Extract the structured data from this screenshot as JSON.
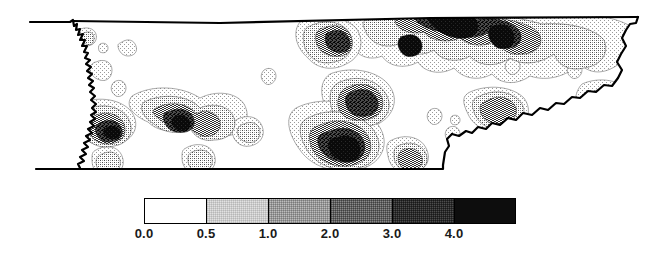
{
  "figure": {
    "type": "contour-map",
    "region": "Tennessee",
    "background_color": "#ffffff",
    "outline_color": "#000000"
  },
  "chart_data": {
    "type": "heatmap",
    "title": "",
    "subtitle": "",
    "xlabel": "",
    "ylabel": "",
    "projection": "state-outline",
    "region": "Tennessee",
    "grid": false,
    "legend_position": "bottom-center",
    "contour_levels": [
      0.0,
      0.5,
      1.0,
      2.0,
      3.0,
      4.0
    ],
    "level_labels": [
      "0.0",
      "0.5",
      "1.0",
      "2.0",
      "3.0",
      "4.0"
    ],
    "bands": [
      {
        "range": "0.0 - 0.5",
        "low": 0.0,
        "high": 0.5,
        "color": "#ffffff",
        "density": 0
      },
      {
        "range": "0.5 - 1.0",
        "low": 0.5,
        "high": 1.0,
        "color": "#e2e2e2",
        "density": 18
      },
      {
        "range": "1.0 - 2.0",
        "low": 1.0,
        "high": 2.0,
        "color": "#bdbdbd",
        "density": 36
      },
      {
        "range": "2.0 - 3.0",
        "low": 2.0,
        "high": 3.0,
        "color": "#8a8a8a",
        "density": 58
      },
      {
        "range": "3.0 - 4.0",
        "low": 3.0,
        "high": 4.0,
        "color": "#4d4d4d",
        "density": 78
      },
      {
        "range": "4.0 +",
        "low": 4.0,
        "high": null,
        "color": "#0d0d0d",
        "density": 100
      }
    ],
    "hotspots": [
      {
        "label": "northeast-maximum",
        "x": 0.735,
        "y": 0.16,
        "value": 4.5
      },
      {
        "label": "north-central-maximum",
        "x": 0.64,
        "y": 0.24,
        "value": 4.3
      },
      {
        "label": "south-central-maximum",
        "x": 0.545,
        "y": 0.69,
        "value": 4.2
      },
      {
        "label": "west-tennessee-peak",
        "x": 0.255,
        "y": 0.53,
        "value": 3.2
      },
      {
        "label": "mississippi-river-peak",
        "x": 0.075,
        "y": 0.46,
        "value": 2.6
      },
      {
        "label": "southern-border-peak",
        "x": 0.655,
        "y": 0.83,
        "value": 2.8
      }
    ]
  },
  "legend": {
    "name": "contour-scale",
    "ticks": [
      {
        "label": "0.0",
        "position": 0.0
      },
      {
        "label": "0.5",
        "position": 0.1667
      },
      {
        "label": "1.0",
        "position": 0.3333
      },
      {
        "label": "2.0",
        "position": 0.5
      },
      {
        "label": "3.0",
        "position": 0.6667
      },
      {
        "label": "4.0",
        "position": 0.8333
      }
    ]
  }
}
